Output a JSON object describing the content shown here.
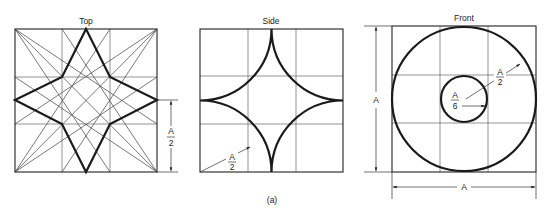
{
  "figure": {
    "caption": "(a)",
    "views": [
      {
        "title": "Top",
        "dimension_label": {
          "num": "A",
          "den": "2"
        }
      },
      {
        "title": "Side",
        "dimension_label": {
          "num": "A",
          "den": "2"
        }
      },
      {
        "title": "Front",
        "outer_radius_label": {
          "num": "A",
          "den": "2"
        },
        "inner_radius_label": {
          "num": "A",
          "den": "6"
        },
        "height_label": "A",
        "width_label": "A"
      }
    ]
  },
  "colors": {
    "background": "#ffffff",
    "ink": "#1a1a1a"
  }
}
